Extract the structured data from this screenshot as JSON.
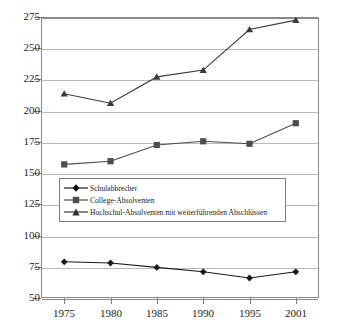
{
  "chart_data": {
    "type": "line",
    "title": "",
    "xlabel": "",
    "ylabel": "",
    "categories": [
      "1975",
      "1980",
      "1985",
      "1990",
      "1995",
      "2001"
    ],
    "x": [
      1975,
      1980,
      1985,
      1990,
      1995,
      2001
    ],
    "ylim": [
      50,
      275
    ],
    "yticks": [
      50,
      75,
      100,
      125,
      150,
      175,
      200,
      225,
      250,
      275
    ],
    "ytick_labels": [
      "50",
      "75",
      "100",
      "125",
      "150",
      "175",
      "200",
      "225",
      "250",
      "275"
    ],
    "grid": true,
    "legend_position": "inside-lower-left",
    "series": [
      {
        "name": "Schulabbrecher",
        "marker": "diamond",
        "color": "#1a1a1a",
        "values": [
          79,
          78,
          74.5,
          71,
          66,
          71
        ]
      },
      {
        "name": "College-Absolventen",
        "marker": "square",
        "color": "#4d4d4d",
        "values": [
          157,
          159.5,
          172.5,
          175.5,
          173.5,
          190
        ]
      },
      {
        "name": "Hochschul-Absolventen mit weiterführenden Abschlüssen",
        "marker": "triangle",
        "color": "#3a3a3a",
        "values": [
          213.5,
          206,
          227,
          232.5,
          265,
          272.5
        ]
      }
    ]
  },
  "legend": {
    "items": [
      {
        "label": "Schulabbrecher"
      },
      {
        "label": "College-Absolventen"
      },
      {
        "label": "Hochschul-Absolventen mit weiterführenden Abschlüssen"
      }
    ]
  },
  "axes": {
    "y_labels": [
      "275",
      "250",
      "225",
      "200",
      "175",
      "150",
      "125",
      "100",
      "75",
      "50"
    ],
    "x_labels": [
      "1975",
      "1980",
      "1985",
      "1990",
      "1995",
      "2001"
    ]
  }
}
